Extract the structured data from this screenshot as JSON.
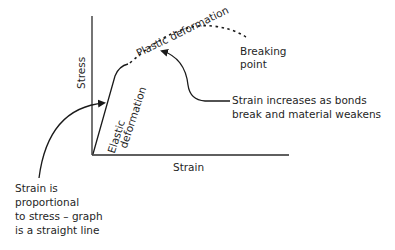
{
  "diagram": {
    "axes": {
      "x_label": "Strain",
      "y_label": "Stress"
    },
    "regions": {
      "elastic": [
        "Elastic",
        "deformation"
      ],
      "plastic": "Plastic deformation"
    },
    "annotations": {
      "breaking_point": [
        "Breaking",
        "point"
      ],
      "bonds_break": [
        "Strain increases as bonds",
        "break and material weakens"
      ],
      "proportional": [
        "Strain is",
        "proportional",
        "to stress – graph",
        "is a straight line"
      ]
    },
    "colors": {
      "line": "#1a1a1a",
      "axis": "#2a2a2a",
      "background": "#ffffff"
    }
  }
}
